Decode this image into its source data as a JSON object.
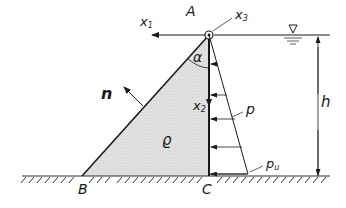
{
  "diagram": {
    "points": {
      "A": {
        "label": "A"
      },
      "B": {
        "label": "B"
      },
      "C": {
        "label": "C"
      }
    },
    "axes": {
      "x1": {
        "label": "x",
        "sub": "1"
      },
      "x2": {
        "label": "x",
        "sub": "2"
      },
      "x3": {
        "label": "x",
        "sub": "3"
      }
    },
    "symbols": {
      "angle": "α",
      "normal": "n",
      "density": "ϱ",
      "pressure": "p",
      "pressure_bottom": {
        "label": "p",
        "sub": "u"
      },
      "height": "h"
    },
    "colors": {
      "line": "#1a1a1a",
      "fill": "#d9d9d9",
      "background": "#ffffff"
    }
  }
}
